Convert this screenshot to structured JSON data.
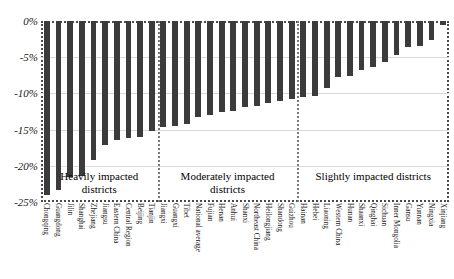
{
  "chart_data": {
    "type": "bar",
    "title": "",
    "subtitle": "",
    "xlabel": "",
    "ylabel": "",
    "ylim": [
      -25,
      0
    ],
    "ytick_labels": [
      "0%",
      "-5%",
      "-10%",
      "-15%",
      "-20%",
      "-25%"
    ],
    "ytick_values": [
      0,
      -5,
      -10,
      -15,
      -20,
      -25
    ],
    "grid": true,
    "legend": "none",
    "value_unit": "percent",
    "categories": [
      "Chongqing",
      "Guangdong",
      "Jilin",
      "Shanghai",
      "Zhejiang",
      "Jiangsu",
      "Eastern China",
      "Central Region",
      "Beijing",
      "Tianjin",
      "Jiangxi",
      "Guangxi",
      "Tibet",
      "National average",
      "Fujian",
      "Henan",
      "Anhui",
      "Shanxi",
      "Northeast China",
      "Heilongjiang",
      "Shandong",
      "Guizhou",
      "Hainan",
      "Hebei",
      "Liaoning",
      "Western China",
      "Hunan",
      "Shaanxi",
      "Qinghai",
      "Sichuan",
      "Inner Mongolia",
      "Gansu",
      "Yunnan",
      "Ningxia",
      "Xinjiang"
    ],
    "values": [
      -24.0,
      -23.3,
      -21.6,
      -21.4,
      -19.2,
      -17.1,
      -16.4,
      -16.2,
      -16.0,
      -15.2,
      -14.6,
      -14.5,
      -14.2,
      -13.2,
      -13.0,
      -12.6,
      -12.4,
      -11.9,
      -11.7,
      -11.3,
      -11.1,
      -10.8,
      -10.5,
      -10.4,
      -9.3,
      -7.7,
      -7.6,
      -6.8,
      -6.3,
      -5.6,
      -4.7,
      -3.6,
      -3.4,
      -2.6,
      -0.5
    ],
    "annotations": [
      {
        "text_line1": "Heavily impacted",
        "text_line2": "districts",
        "group": "heavily"
      },
      {
        "text_line1": "Moderately impacted",
        "text_line2": "districts",
        "group": "moderately"
      },
      {
        "text_line1": "Slightly impacted districts",
        "text_line2": "",
        "group": "slightly"
      }
    ],
    "group_boundaries": [
      10,
      22
    ],
    "bar_color": "#3b3b3b",
    "grid_color": "#d9d9d9",
    "frame_color": "#4a4a4a"
  }
}
